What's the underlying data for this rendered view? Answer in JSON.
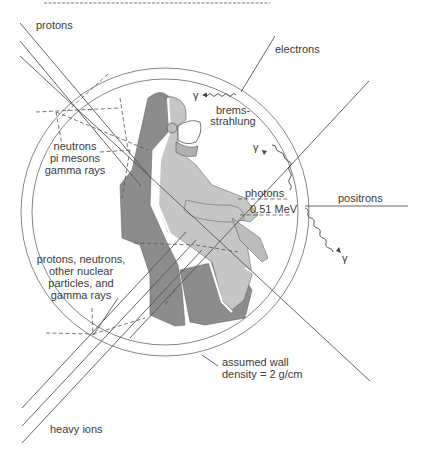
{
  "figure": {
    "labels": {
      "protons": "protons",
      "electrons": "electrons",
      "brems_line1": "brems-",
      "brems_line2": "strahlung",
      "gamma_symbol": "γ",
      "secondary1_line1": "neutrons",
      "secondary1_line2": "pi mesons",
      "secondary1_line3": "gamma rays",
      "photons": "photons",
      "photon_energy": "0.51 MeV",
      "positrons": "positrons",
      "secondary2_line1": "protons, neutrons,",
      "secondary2_line2": "other nuclear",
      "secondary2_line3": "particles, and",
      "secondary2_line4": "gamma rays",
      "wall_line1": "assumed wall",
      "wall_line2": "density = 2 g/cm",
      "heavy_ions": "heavy ions"
    },
    "colors": {
      "seat": "#8c8c8c",
      "suit": "#c6c6c6",
      "outline": "#ffffff",
      "lines": "#555555"
    }
  }
}
